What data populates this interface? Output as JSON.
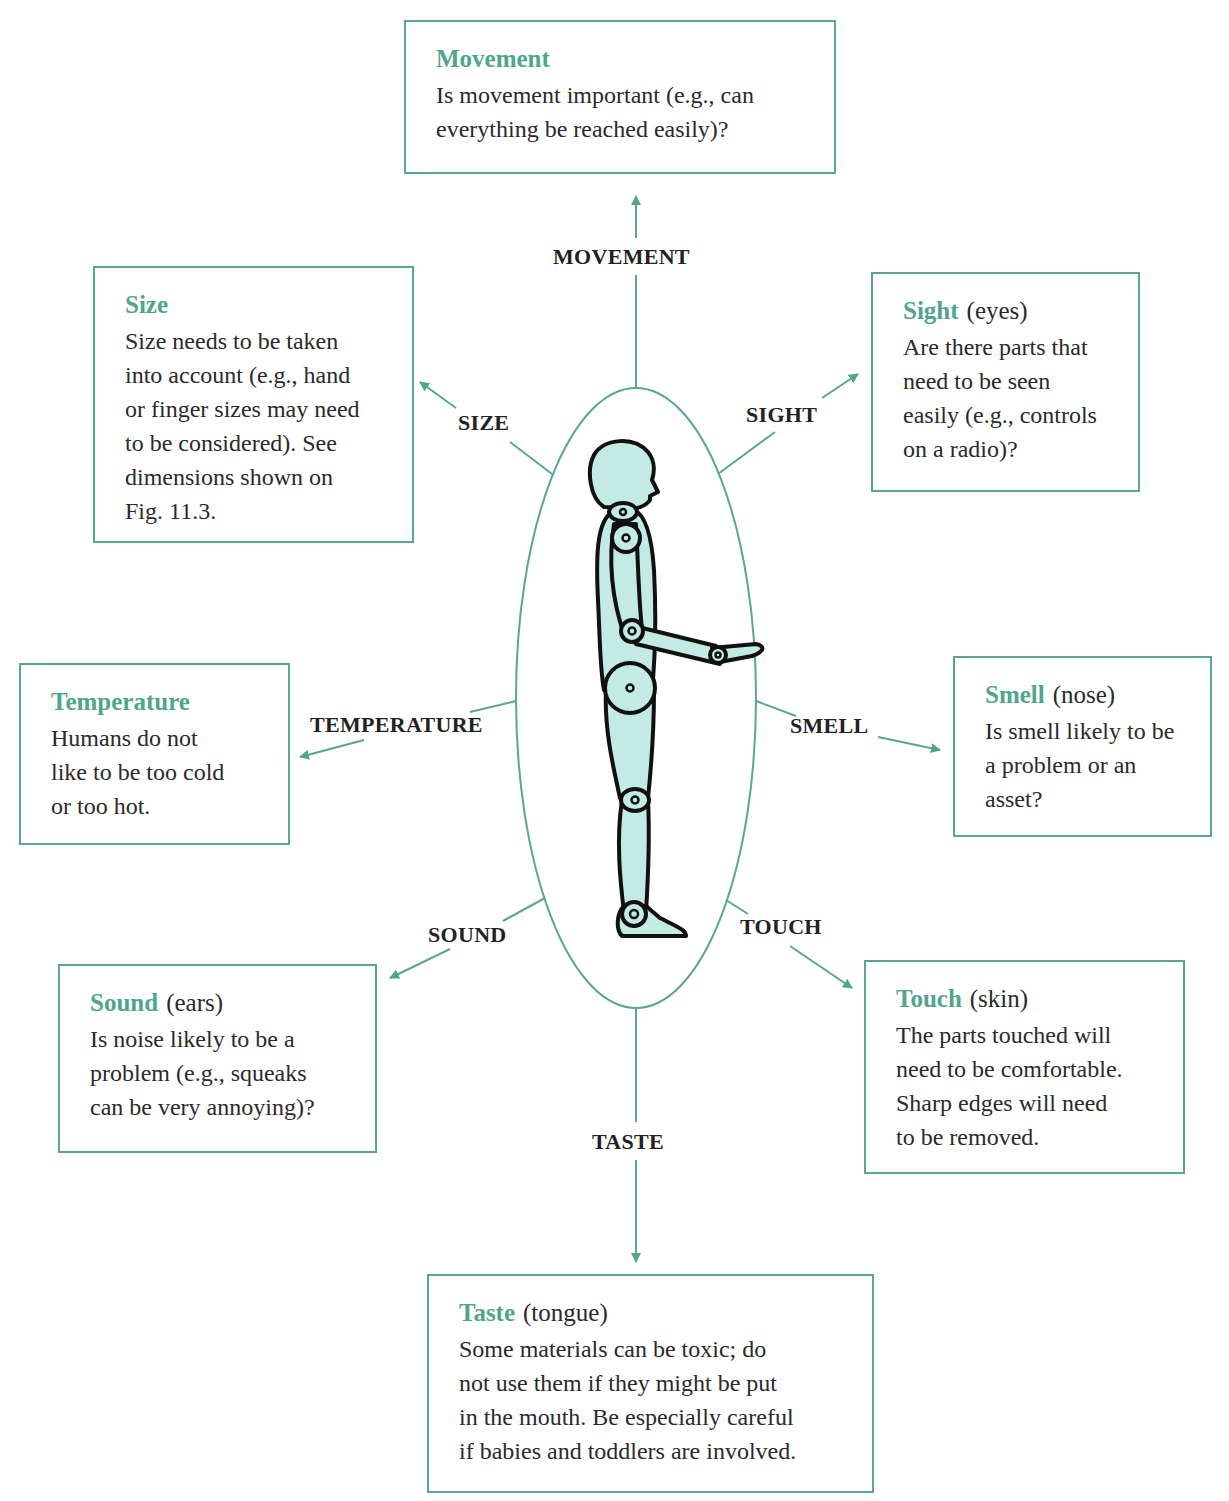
{
  "colors": {
    "accent": "#4fa68c",
    "line": "#5aa593",
    "figure_fill": "#c4ebe3",
    "figure_stroke": "#111111"
  },
  "center": {
    "figure": "human-mannequin-figure"
  },
  "senses": [
    {
      "id": "movement",
      "label": "MOVEMENT",
      "title": "Movement",
      "sub": "",
      "text": "Is movement important (e.g., can\neverything be reached easily)?"
    },
    {
      "id": "size",
      "label": "SIZE",
      "title": "Size",
      "sub": "",
      "text": "Size needs to be taken\ninto account (e.g., hand\nor finger sizes may need\nto be considered). See\ndimensions shown on\nFig. 11.3."
    },
    {
      "id": "sight",
      "label": "SIGHT",
      "title": "Sight",
      "sub": "(eyes)",
      "text": "Are there parts that\nneed to be seen\neasily (e.g., controls\non a radio)?"
    },
    {
      "id": "temperature",
      "label": "TEMPERATURE",
      "title": "Temperature",
      "sub": "",
      "text": "Humans do not\nlike to be too cold\nor too hot."
    },
    {
      "id": "smell",
      "label": "SMELL",
      "title": "Smell",
      "sub": "(nose)",
      "text": "Is smell likely to be\na problem or an\nasset?"
    },
    {
      "id": "sound",
      "label": "SOUND",
      "title": "Sound",
      "sub": "(ears)",
      "text": "Is noise likely to be a\nproblem (e.g., squeaks\ncan be very annoying)?"
    },
    {
      "id": "touch",
      "label": "TOUCH",
      "title": "Touch",
      "sub": "(skin)",
      "text": "The parts touched will\nneed to be comfortable.\nSharp edges will need\nto be removed."
    },
    {
      "id": "taste",
      "label": "TASTE",
      "title": "Taste",
      "sub": "(tongue)",
      "text": "Some materials can be toxic; do\nnot use them if they might be put\nin the mouth. Be especially careful\nif babies and toddlers are involved."
    }
  ]
}
